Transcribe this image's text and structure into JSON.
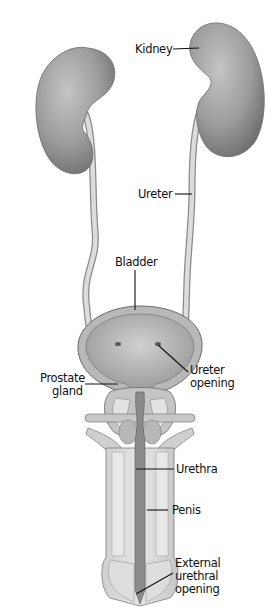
{
  "diagram": {
    "labels": {
      "kidney": "Kidney",
      "ureter": "Ureter",
      "bladder": "Bladder",
      "ureter_opening_1": "Ureter",
      "ureter_opening_2": "opening",
      "prostate_1": "Prostate",
      "prostate_2": "gland",
      "urethra": "Urethra",
      "penis": "Penis",
      "external_1": "External",
      "external_2": "urethral",
      "external_3": "opening"
    },
    "colors": {
      "organ_fill": "#9a9a9a",
      "organ_light": "#c8c8c8",
      "tube_fill": "#d8d8d8",
      "line": "#111111",
      "background": "#ffffff"
    }
  }
}
